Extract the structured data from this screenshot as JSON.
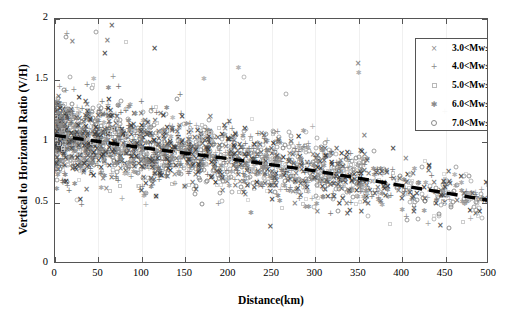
{
  "chart_data": {
    "type": "scatter",
    "title": "",
    "xlabel": "Distance(km)",
    "ylabel": "Vertical to Horizontal Ratio (V/H)",
    "xlim": [
      0,
      500
    ],
    "ylim": [
      0,
      2
    ],
    "xticks": [
      0,
      50,
      100,
      150,
      200,
      250,
      300,
      350,
      400,
      450,
      500
    ],
    "yticks": [
      0,
      0.5,
      1,
      1.5,
      2
    ],
    "grid": "faint vertical gridlines at major x ticks",
    "legend_position": "top-right inside axes",
    "series": [
      {
        "name": "3.0<Mw≤4.0",
        "marker": "cross-x",
        "color": "#3a3a3a"
      },
      {
        "name": "4.0<Mw≤5.0",
        "marker": "plus",
        "color": "#6e6e6e"
      },
      {
        "name": "5.0<Mw≤6.0",
        "marker": "square",
        "color": "#c8c8c8"
      },
      {
        "name": "6.0<Mw≤7.0",
        "marker": "asterisk",
        "color": "#8e8e8e"
      },
      {
        "name": "7.0<Mw≤8.0",
        "marker": "circle",
        "color": "#8a8a8a"
      }
    ],
    "annotations": [
      {
        "type": "trend-line",
        "style": "thick black dashed",
        "points": [
          [
            0,
            1.05
          ],
          [
            100,
            0.95
          ],
          [
            200,
            0.86
          ],
          [
            300,
            0.76
          ],
          [
            400,
            0.64
          ],
          [
            500,
            0.52
          ]
        ]
      }
    ]
  },
  "axes": {
    "xlabel": "Distance(km)",
    "ylabel": "Vertical to Horizontal Ratio (V/H)",
    "xtick_labels": [
      "0",
      "50",
      "100",
      "150",
      "200",
      "250",
      "300",
      "350",
      "400",
      "450",
      "500"
    ],
    "ytick_labels": [
      "0",
      "0.5",
      "1",
      "1.5",
      "2"
    ]
  },
  "legend": {
    "entries": [
      {
        "label": "3.0<Mw≤4.0",
        "glyph": "×",
        "icon": "cross-x-marker-icon"
      },
      {
        "label": "4.0<Mw≤5.0",
        "glyph": "+",
        "icon": "plus-marker-icon"
      },
      {
        "label": "5.0<Mw≤6.0",
        "glyph": "",
        "icon": "square-marker-icon"
      },
      {
        "label": "6.0<Mw≤7.0",
        "glyph": "✱",
        "icon": "asterisk-marker-icon"
      },
      {
        "label": "7.0<Mw≤8.0",
        "glyph": "",
        "icon": "circle-marker-icon"
      }
    ]
  },
  "colors": {
    "axis": "#555555",
    "grid": "#f0f0f0",
    "trend_line": "#000000",
    "background": "#ffffff"
  }
}
